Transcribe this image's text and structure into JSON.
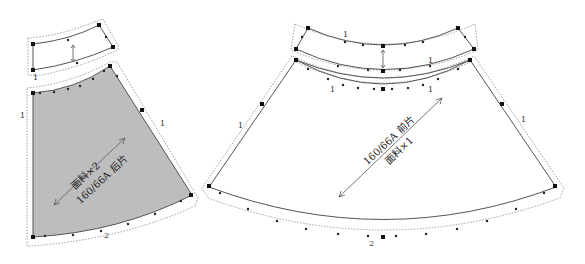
{
  "diagram": {
    "type": "sewing-pattern",
    "background": "#ffffff",
    "pieces": [
      {
        "id": "back-waistband",
        "shape": "curved-band",
        "fill": "#ffffff",
        "marks": [
          "1"
        ]
      },
      {
        "id": "back-skirt",
        "shape": "sector",
        "fill": "#bdbdbd",
        "size_label": "160/66A",
        "name_label": "后片",
        "fabric_label": "面料×2",
        "edge_marks": [
          "1",
          "1",
          "2"
        ]
      },
      {
        "id": "front-waistband",
        "shape": "curved-band",
        "fill": "#ffffff",
        "marks": [
          "1",
          "1"
        ]
      },
      {
        "id": "front-skirt",
        "shape": "sector",
        "fill": "#ffffff",
        "size_label": "160/66A",
        "name_label": "前片",
        "fabric_label": "面料×1",
        "edge_marks": [
          "1",
          "1",
          "1",
          "1",
          "2"
        ]
      }
    ]
  }
}
